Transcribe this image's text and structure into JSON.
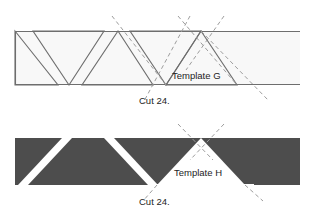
{
  "figure": {
    "type": "sewing-template-cutting-diagram",
    "background_color": "#ffffff",
    "width": 316,
    "height": 216
  },
  "strips": [
    {
      "id": "strip-g",
      "name": "light-fabric-strip",
      "fill_color": "#f7f7f7",
      "outline_color": "#6e6e6e",
      "x": 15,
      "y": 31,
      "width": 285,
      "height": 54,
      "triangle_style": "outlined",
      "template_label": "Template G",
      "cut_label": "Cut 24."
    },
    {
      "id": "strip-h",
      "name": "dark-fabric-strip",
      "fill_color": "#4d4d4d",
      "outline_color": "#4d4d4d",
      "x": 15,
      "y": 138,
      "width": 285,
      "height": 47,
      "triangle_style": "solid",
      "template_label": "Template H",
      "cut_label": "Cut 24."
    }
  ],
  "labels": {
    "template_g": "Template G",
    "cut_g": "Cut 24.",
    "template_h": "Template H",
    "cut_h": "Cut 24."
  },
  "guide_lines": {
    "name": "dashed-cut-guide-lines",
    "color": "#9a9a9a",
    "dash_pattern": "4 3",
    "description": "X-shaped dashed crossing marks at triangle apex points"
  },
  "colors": {
    "light_fill": "#f7f7f7",
    "dark_fill": "#4d4d4d",
    "outline": "#6e6e6e",
    "dash": "#9a9a9a",
    "text": "#1d1d1d",
    "page": "#ffffff"
  }
}
